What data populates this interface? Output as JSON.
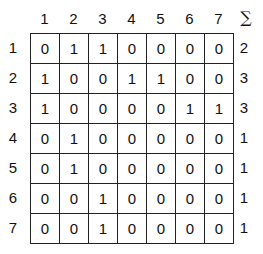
{
  "matrix": {
    "column_headers": [
      "1",
      "2",
      "3",
      "4",
      "5",
      "6",
      "7"
    ],
    "sum_header": "∑",
    "row_headers": [
      "1",
      "2",
      "3",
      "4",
      "5",
      "6",
      "7"
    ],
    "rows": [
      [
        "0",
        "1",
        "1",
        "0",
        "0",
        "0",
        "0"
      ],
      [
        "1",
        "0",
        "0",
        "1",
        "1",
        "0",
        "0"
      ],
      [
        "1",
        "0",
        "0",
        "0",
        "0",
        "1",
        "1"
      ],
      [
        "0",
        "1",
        "0",
        "0",
        "0",
        "0",
        "0"
      ],
      [
        "0",
        "1",
        "0",
        "0",
        "0",
        "0",
        "0"
      ],
      [
        "0",
        "0",
        "1",
        "0",
        "0",
        "0",
        "0"
      ],
      [
        "0",
        "0",
        "1",
        "0",
        "0",
        "0",
        "0"
      ]
    ],
    "row_sums": [
      "2",
      "3",
      "3",
      "1",
      "1",
      "1",
      "1"
    ]
  }
}
